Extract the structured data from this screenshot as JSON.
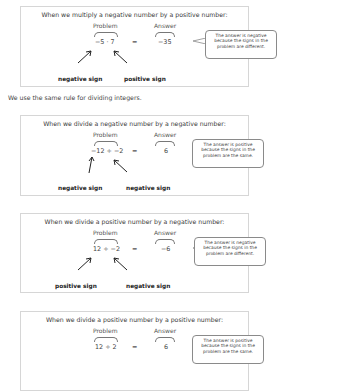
{
  "intro_sentence": "We use the same rule for dividing integers.",
  "labels": {
    "problem": "Problem",
    "answer": "Answer",
    "equals": "="
  },
  "boxes": [
    {
      "heading": "When we multiply a negative number by a positive number:",
      "expression": "−5 · 7",
      "answer": "−35",
      "callout": "The answer is negative because the signs in the problem are different.",
      "left_sign": "negative sign",
      "right_sign": "positive sign"
    },
    {
      "heading": "When we divide a negative number by a negative number:",
      "expression": "−12 ÷ −2",
      "answer": "6",
      "callout": "The answer is positive because the signs in the problem are the same.",
      "left_sign": "negative sign",
      "right_sign": "negative sign"
    },
    {
      "heading": "When we divide a positive number by a negative number:",
      "expression": "12 ÷ −2",
      "answer": "−6",
      "callout": "The answer is negative because the signs in the problem are different.",
      "left_sign": "positive sign",
      "right_sign": "negative sign"
    },
    {
      "heading": "When we divide a positive number by a positive number:",
      "expression": "12 ÷ 2",
      "answer": "6",
      "callout": "The answer is positive because the signs in the problem are the same.",
      "left_sign": "positive sign",
      "right_sign": "positive sign"
    }
  ]
}
